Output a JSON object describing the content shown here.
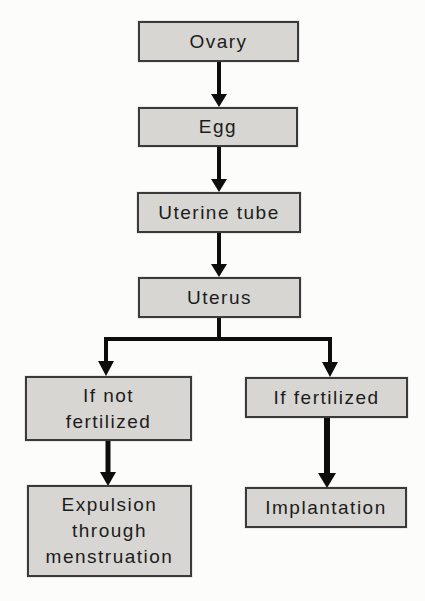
{
  "diagram": {
    "type": "flowchart",
    "nodes": [
      {
        "id": "ovary",
        "label": "Ovary"
      },
      {
        "id": "egg",
        "label": "Egg"
      },
      {
        "id": "uterine-tube",
        "label": "Uterine tube"
      },
      {
        "id": "uterus",
        "label": "Uterus"
      },
      {
        "id": "if-not-fertilized",
        "label": "If not\nfertilized"
      },
      {
        "id": "if-fertilized",
        "label": "If fertilized"
      },
      {
        "id": "expulsion",
        "label": "Expulsion\nthrough\nmenstruation"
      },
      {
        "id": "implantation",
        "label": "Implantation"
      }
    ],
    "edges": [
      {
        "from": "ovary",
        "to": "egg"
      },
      {
        "from": "egg",
        "to": "uterine-tube"
      },
      {
        "from": "uterine-tube",
        "to": "uterus"
      },
      {
        "from": "uterus",
        "to": "if-not-fertilized"
      },
      {
        "from": "uterus",
        "to": "if-fertilized"
      },
      {
        "from": "if-not-fertilized",
        "to": "expulsion"
      },
      {
        "from": "if-fertilized",
        "to": "implantation"
      }
    ],
    "colors": {
      "background": "#fcfcfa",
      "box_fill": "#d7d6d2",
      "box_border": "#3a3a3a",
      "arrow": "#0d0d0d",
      "text": "#1c1c1c"
    }
  }
}
